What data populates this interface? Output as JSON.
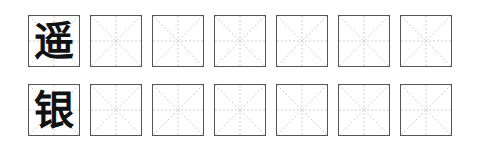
{
  "worksheet": {
    "rows": [
      {
        "character": "遥",
        "practice_cells": 6
      },
      {
        "character": "银",
        "practice_cells": 6
      }
    ],
    "colors": {
      "border": "#555555",
      "guide": "#bbbbbb",
      "ink": "#111111"
    }
  }
}
